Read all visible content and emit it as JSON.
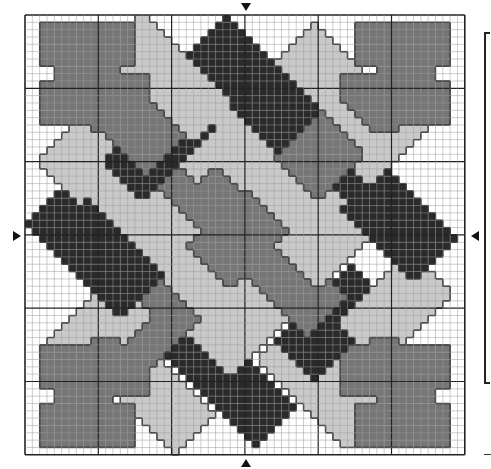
{
  "chart_title": "Cross-stitch pattern chart (Celtic weave)",
  "grid": {
    "cols": 60,
    "rows": 60,
    "origin_x": 25,
    "origin_y": 15,
    "cell_size": 7.33,
    "major_every": 10,
    "minor_line_color": "#9a9a9a",
    "major_line_color": "#222222",
    "border_color": "#222222"
  },
  "colors": {
    "background": "#ffffff",
    "D": "#2a2a2a",
    "M": "#767676",
    "L": "#c9c9c9",
    "outline": "#111111"
  },
  "center_markers": [
    "top",
    "bottom",
    "left",
    "right"
  ],
  "panels": [
    {
      "c": "L",
      "cx": 19.5,
      "cy": 8.5,
      "o": "a",
      "l": 9,
      "w": 4
    },
    {
      "c": "D",
      "cx": 31,
      "cy": 9.5,
      "o": "a",
      "l": 9,
      "w": 4
    },
    {
      "c": "L",
      "cx": 43,
      "cy": 10,
      "o": "a",
      "l": 9,
      "w": 4
    },
    {
      "c": "M",
      "cx": 14,
      "cy": 14,
      "o": "a",
      "l": 7,
      "w": 4
    },
    {
      "c": "D",
      "cx": 18.5,
      "cy": 17.5,
      "o": "b",
      "l": 7,
      "w": 4
    },
    {
      "c": "L",
      "cx": 25.5,
      "cy": 15,
      "o": "b",
      "l": 7,
      "w": 4
    },
    {
      "c": "M",
      "cx": 42,
      "cy": 17.5,
      "o": "b",
      "l": 7,
      "w": 4
    },
    {
      "c": "L",
      "cx": 50,
      "cy": 15,
      "o": "b",
      "l": 8,
      "w": 4
    },
    {
      "c": "L",
      "cx": 9.5,
      "cy": 18,
      "o": "b",
      "l": 7,
      "w": 4
    },
    {
      "c": "L",
      "cx": 13.5,
      "cy": 24.5,
      "o": "a",
      "l": 7,
      "w": 4
    },
    {
      "c": "M",
      "cx": 23.5,
      "cy": 23.5,
      "o": "a",
      "l": 7,
      "w": 4
    },
    {
      "c": "L",
      "cx": 36,
      "cy": 23.5,
      "o": "a",
      "l": 7,
      "w": 4
    },
    {
      "c": "L",
      "cx": 30,
      "cy": 18,
      "o": "b",
      "l": 7,
      "w": 4
    },
    {
      "c": "D",
      "cx": 49.5,
      "cy": 27,
      "o": "a",
      "l": 9,
      "w": 4
    },
    {
      "c": "D",
      "cx": 9.5,
      "cy": 32,
      "o": "a",
      "l": 9,
      "w": 4
    },
    {
      "c": "L",
      "cx": 18,
      "cy": 29.5,
      "o": "b",
      "l": 7,
      "w": 4
    },
    {
      "c": "M",
      "cx": 30,
      "cy": 29.5,
      "o": "b",
      "l": 7,
      "w": 4
    },
    {
      "c": "L",
      "cx": 42,
      "cy": 29.5,
      "o": "b",
      "l": 7,
      "w": 4
    },
    {
      "c": "L",
      "cx": 24,
      "cy": 35.5,
      "o": "a",
      "l": 7,
      "w": 4
    },
    {
      "c": "M",
      "cx": 36,
      "cy": 36,
      "o": "a",
      "l": 7,
      "w": 4
    },
    {
      "c": "L",
      "cx": 50.5,
      "cy": 40,
      "o": "b",
      "l": 7,
      "w": 4
    },
    {
      "c": "L",
      "cx": 9.5,
      "cy": 43.5,
      "o": "b",
      "l": 7,
      "w": 4
    },
    {
      "c": "M",
      "cx": 18,
      "cy": 42,
      "o": "b",
      "l": 7,
      "w": 4
    },
    {
      "c": "L",
      "cx": 30,
      "cy": 41.5,
      "o": "b",
      "l": 7,
      "w": 4
    },
    {
      "c": "D",
      "cx": 42,
      "cy": 42,
      "o": "b",
      "l": 7,
      "w": 4
    },
    {
      "c": "L",
      "cx": 17,
      "cy": 51,
      "o": "a",
      "l": 9,
      "w": 4
    },
    {
      "c": "D",
      "cx": 28,
      "cy": 50,
      "o": "a",
      "l": 9,
      "w": 4
    },
    {
      "c": "L",
      "cx": 40.5,
      "cy": 50.5,
      "o": "a",
      "l": 9,
      "w": 4
    },
    {
      "c": "M",
      "cx": 46.5,
      "cy": 46.5,
      "o": "a",
      "l": 7,
      "w": 4
    }
  ],
  "fleurs": [
    {
      "corner": "tl",
      "c": "M"
    },
    {
      "corner": "tr",
      "c": "M"
    },
    {
      "corner": "bl",
      "c": "M"
    },
    {
      "corner": "br",
      "c": "M"
    }
  ]
}
